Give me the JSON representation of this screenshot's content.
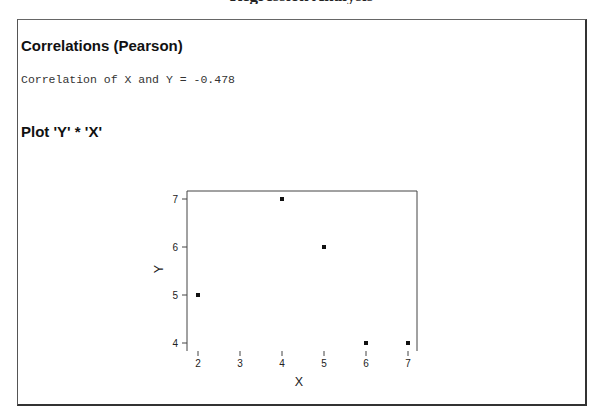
{
  "page": {
    "clipped_header": "Regression Analysis"
  },
  "correlations": {
    "heading": "Correlations (Pearson)",
    "result_line": "Correlation of X and Y = -0.478"
  },
  "plot_section": {
    "heading": "Plot 'Y' * 'X'"
  },
  "colors": {
    "frame_border": "#333333",
    "axis_line": "#444444",
    "point": "#111111",
    "axis_gradient_start": "#3fb6c7",
    "axis_gradient_end": "#e8484f"
  },
  "chart_data": {
    "type": "scatter",
    "title": "Plot 'Y' * 'X'",
    "xlabel": "X",
    "ylabel": "Y",
    "x": [
      2,
      4,
      5,
      6,
      7
    ],
    "y": [
      5,
      7,
      6,
      4,
      4
    ],
    "points": [
      {
        "x": 2,
        "y": 5
      },
      {
        "x": 4,
        "y": 7
      },
      {
        "x": 5,
        "y": 6
      },
      {
        "x": 6,
        "y": 4
      },
      {
        "x": 7,
        "y": 4
      }
    ],
    "xticks": [
      2,
      3,
      4,
      5,
      6,
      7
    ],
    "yticks": [
      4,
      5,
      6,
      7
    ],
    "xlim": [
      1.75,
      7.25
    ],
    "ylim": [
      3.83,
      7.17
    ],
    "grid": false,
    "legend": null,
    "annotation": "Correlation of X and Y = -0.478"
  }
}
